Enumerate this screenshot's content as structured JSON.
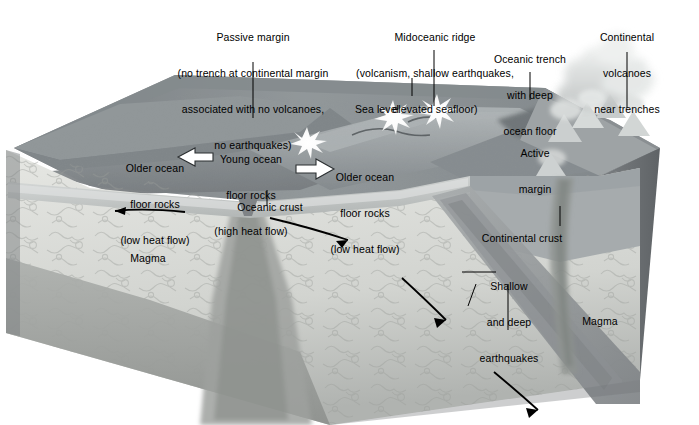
{
  "figure": {
    "type": "geologic-block-diagram",
    "background_color": "#ffffff",
    "palette": {
      "sea_surface": "#8f9396",
      "ocean_water": "#7c8083",
      "seafloor": "#9aa0a2",
      "ridge_crest": "#b3b8ba",
      "continental_crust_face": "#a9aeb0",
      "oceanic_crust_band": "#c9cdcd",
      "mantle_light": "#dfe1dd",
      "mantle_mid": "#b9bcb8",
      "mantle_dark": "#8d9093",
      "right_side_face": "#6f7376",
      "slab": "#9da2a3",
      "volcano_plume": "#d8dbdb",
      "burst_white": "#ffffff",
      "line": "#000000",
      "text": "#000000"
    }
  },
  "callouts": {
    "passive_margin": {
      "lines": [
        "Passive margin",
        "(no trench at continental margin",
        "associated with no volcanoes,",
        "no earthquakes)"
      ]
    },
    "midoceanic_ridge": {
      "lines": [
        "Midoceanic ridge",
        "(volcanism, shallow earthquakes,",
        "elevated seafloor)"
      ]
    },
    "oceanic_trench": {
      "lines": [
        "Oceanic trench",
        "with deep",
        "ocean floor"
      ]
    },
    "continental_volcanoes": {
      "lines": [
        "Continental",
        "volcanoes",
        "near trenches"
      ]
    },
    "sea_level": {
      "lines": [
        "Sea level"
      ]
    },
    "older_ocean_floor_left": {
      "lines": [
        "Older ocean",
        "floor rocks",
        "(low heat flow)"
      ]
    },
    "young_ocean_floor": {
      "lines": [
        "Young ocean",
        "floor rocks",
        "(high heat flow)"
      ]
    },
    "older_ocean_floor_right": {
      "lines": [
        "Older ocean",
        "floor rocks",
        "(low heat flow)"
      ]
    },
    "oceanic_crust": {
      "lines": [
        "Oceanic crust"
      ]
    },
    "active_margin": {
      "lines": [
        "Active",
        "margin"
      ]
    },
    "continental_crust": {
      "lines": [
        "Continental crust"
      ]
    },
    "shallow_deep_earthquakes": {
      "lines": [
        "Shallow",
        "and deep",
        "earthquakes"
      ]
    },
    "magma_left": {
      "lines": [
        "Magma"
      ]
    },
    "magma_right": {
      "lines": [
        "Magma"
      ]
    }
  },
  "annotations": {
    "spreading_arrow_left_label": "spreading-arrow-left",
    "spreading_arrow_right_label": "spreading-arrow-right",
    "mantle_flow_arrow_left_label": "mantle-flow-arrow-left",
    "mantle_flow_arrow_right_label": "mantle-flow-arrow-right",
    "slab_arrow_upper_label": "slab-descent-arrow-upper",
    "slab_arrow_lower_label": "slab-descent-arrow-lower",
    "earthquake_bursts_count": 4,
    "volcano_count": 4
  }
}
